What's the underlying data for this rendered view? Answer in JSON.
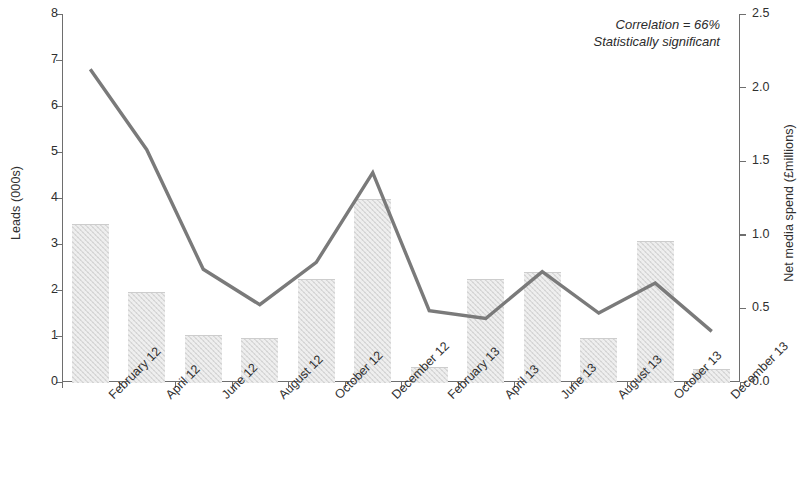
{
  "annotation": {
    "line1": "Correlation = 66%",
    "line2": "Statistically significant"
  },
  "colors": {
    "bar_fill": "#dcdcdc",
    "line": "#7a7a7a",
    "axis": "#6e6e6e",
    "text": "#2f2f2f",
    "background": "#ffffff"
  },
  "chart_data": {
    "type": "bar",
    "title": "",
    "subtitle": "",
    "xlabel": "",
    "ylabel": "Leads (000s)",
    "y2label": "Net media spend (£millions)",
    "ylim": [
      0,
      8
    ],
    "y2lim": [
      0.0,
      2.5
    ],
    "yticks": [
      "0",
      "1",
      "2",
      "3",
      "4",
      "5",
      "6",
      "7",
      "8"
    ],
    "y2ticks": [
      "0.0",
      "0.5",
      "1.0",
      "1.5",
      "2.0",
      "2.5"
    ],
    "grid": false,
    "legend": "none",
    "categories": [
      "February 12",
      "April 12",
      "June 12",
      "August 12",
      "October 12",
      "December 12",
      "February 13",
      "April 13",
      "June 13",
      "August 13",
      "October 13",
      "December 13"
    ],
    "series": [
      {
        "name": "Net media spend (£millions)",
        "type": "bar",
        "axis": "right",
        "values": [
          1.07,
          0.61,
          0.32,
          0.3,
          0.7,
          1.24,
          0.1,
          0.7,
          0.75,
          0.3,
          0.96,
          0.09
        ]
      },
      {
        "name": "Leads (000s)",
        "type": "line",
        "axis": "left",
        "values": [
          6.8,
          5.05,
          2.45,
          1.68,
          2.6,
          4.55,
          1.55,
          1.38,
          2.4,
          1.5,
          2.15,
          1.1
        ]
      }
    ],
    "annotations": [
      "Correlation = 66%",
      "Statistically significant"
    ]
  }
}
